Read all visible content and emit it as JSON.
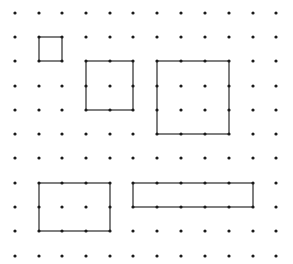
{
  "diagram": {
    "type": "dot-grid",
    "colors": {
      "background": "#ffffff",
      "dot": "#1a1a1a",
      "line": "#2a2a2a"
    },
    "grid": {
      "columns": 12,
      "rows": 11,
      "x_positions": [
        15,
        39,
        62,
        86,
        110,
        133,
        157,
        181,
        205,
        229,
        253,
        276
      ],
      "y_positions": [
        13,
        37,
        61,
        86,
        110,
        134,
        158,
        183,
        207,
        231,
        256
      ],
      "dot_radius": 1.6
    },
    "shapes": [
      {
        "name": "small-square",
        "col_start": 1,
        "row_start": 1,
        "col_end": 2,
        "row_end": 2,
        "width_units": 1,
        "height_units": 1
      },
      {
        "name": "medium-square",
        "col_start": 3,
        "row_start": 2,
        "col_end": 5,
        "row_end": 4,
        "width_units": 2,
        "height_units": 2
      },
      {
        "name": "large-square",
        "col_start": 6,
        "row_start": 2,
        "col_end": 9,
        "row_end": 5,
        "width_units": 3,
        "height_units": 3
      },
      {
        "name": "rectangle-3x2",
        "col_start": 1,
        "row_start": 7,
        "col_end": 4,
        "row_end": 9,
        "width_units": 3,
        "height_units": 2
      },
      {
        "name": "rectangle-5x1",
        "col_start": 5,
        "row_start": 7,
        "col_end": 10,
        "row_end": 8,
        "width_units": 5,
        "height_units": 1
      }
    ]
  }
}
